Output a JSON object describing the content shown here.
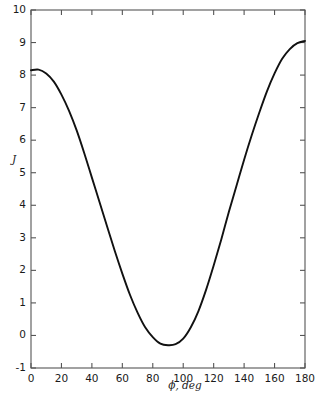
{
  "chart_data": {
    "type": "line",
    "title": "",
    "xlabel": "ϕ, deg",
    "ylabel": "J",
    "xlim": [
      0,
      180
    ],
    "ylim": [
      -1,
      10
    ],
    "grid": false,
    "legend": null,
    "xticks": [
      0,
      20,
      40,
      60,
      80,
      100,
      120,
      140,
      160,
      180
    ],
    "xticklabels": [
      "0",
      "20",
      "40",
      "60",
      "80",
      "100",
      "120",
      "140",
      "160",
      "180"
    ],
    "yticks": [
      -1,
      0,
      1,
      2,
      3,
      4,
      5,
      6,
      7,
      8,
      9,
      10
    ],
    "yticklabels": [
      "-1",
      "0",
      "1",
      "2",
      "3",
      "4",
      "5",
      "6",
      "7",
      "8",
      "9",
      "10"
    ],
    "series": [
      {
        "name": "J",
        "color": "#111111",
        "x": [
          0,
          5,
          10,
          15,
          20,
          25,
          30,
          35,
          40,
          45,
          50,
          55,
          60,
          65,
          70,
          75,
          80,
          85,
          90,
          95,
          100,
          105,
          110,
          115,
          120,
          125,
          130,
          135,
          140,
          145,
          150,
          155,
          160,
          165,
          170,
          175,
          180
        ],
        "y": [
          8.15,
          8.17,
          8.05,
          7.8,
          7.4,
          6.9,
          6.3,
          5.6,
          4.85,
          4.1,
          3.35,
          2.6,
          1.9,
          1.25,
          0.7,
          0.25,
          -0.05,
          -0.25,
          -0.3,
          -0.27,
          -0.1,
          0.25,
          0.75,
          1.4,
          2.15,
          2.95,
          3.8,
          4.6,
          5.4,
          6.15,
          6.85,
          7.5,
          8.05,
          8.5,
          8.8,
          8.98,
          9.05
        ]
      }
    ]
  }
}
